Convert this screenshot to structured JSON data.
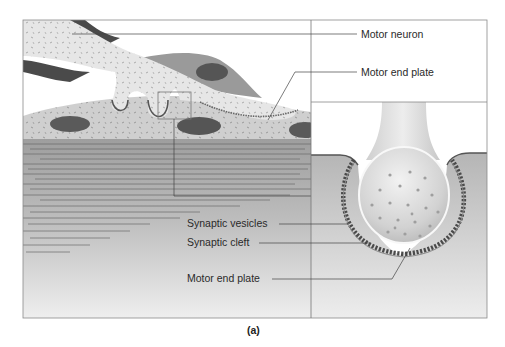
{
  "figure": {
    "caption": "(a)",
    "left_panel": {
      "description": "Neuromuscular junction overview: motor neuron axon terminals resting on muscle fiber with striations"
    },
    "right_panel": {
      "description": "Magnified axon terminal bulb with synaptic vesicles, synaptic cleft and folded motor end plate"
    }
  },
  "labels": {
    "motor_neuron": "Motor neuron",
    "motor_end_plate_top": "Motor end plate",
    "synaptic_vesicles": "Synaptic vesicles",
    "synaptic_cleft": "Synaptic cleft",
    "motor_end_plate_bottom": "Motor end plate"
  },
  "colors": {
    "frame": "#8a8a8a",
    "neuron_fill": "#e4e4e4",
    "muscle_cell_fill": "#c9c9c9",
    "nucleus": "#5a5a5a",
    "striation": "#6a6a6a",
    "muscle_bg_top": "#a8a8a8",
    "muscle_bg_bottom": "#ececec",
    "leader_line": "#444444"
  }
}
